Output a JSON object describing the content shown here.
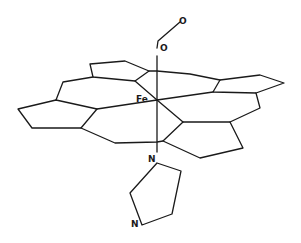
{
  "diagram": {
    "labels": {
      "o_terminal": "O",
      "o_bound": "O",
      "iron": "Fe",
      "n_proximal": "N",
      "n_distal": "N"
    },
    "colors": {
      "line": "#1a1a1a",
      "background": "#ffffff"
    }
  }
}
